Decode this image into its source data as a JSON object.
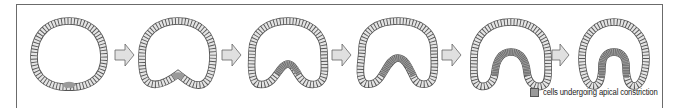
{
  "figure": {
    "title": "",
    "stages": [
      {
        "index": 1,
        "label": "",
        "constricted_cells": "few",
        "invagination": "slight"
      },
      {
        "index": 2,
        "label": "",
        "constricted_cells": "few",
        "invagination": "shallow"
      },
      {
        "index": 3,
        "label": "",
        "constricted_cells": "several",
        "invagination": "moderate"
      },
      {
        "index": 4,
        "label": "",
        "constricted_cells": "several",
        "invagination": "moderate-deep"
      },
      {
        "index": 5,
        "label": "",
        "constricted_cells": "many",
        "invagination": "deep"
      },
      {
        "index": 6,
        "label": "",
        "constricted_cells": "many",
        "invagination": "deep-tube"
      }
    ],
    "arrows_count": 5,
    "legend": {
      "swatch_color": "#9a9a9a",
      "label": "cells undergoing apical constriction"
    },
    "colors": {
      "cell_fill": "#e4e4e4",
      "constricted_fill": "#9a9a9a",
      "outline": "#555555",
      "arrow_fill": "#e0e0e0",
      "arrow_stroke": "#666666",
      "frame": "#6b6b6b"
    }
  }
}
